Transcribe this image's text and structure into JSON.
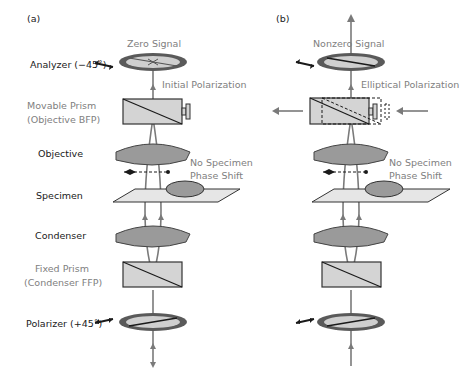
{
  "panels": [
    {
      "id": "a",
      "tag": "(a)",
      "top_label": "Zero Signal",
      "beam_label": "Initial Polarization",
      "specimen_note_line1": "No Specimen",
      "specimen_note_line2": "Phase Shift"
    },
    {
      "id": "b",
      "tag": "(b)",
      "top_label": "Nonzero Signal",
      "beam_label": "Elliptical Polarization",
      "specimen_note_line1": "No Specimen",
      "specimen_note_line2": "Phase Shift"
    }
  ],
  "component_labels": {
    "analyzer": "Analyzer (−45˚)",
    "movable_prism_line1": "Movable Prism",
    "movable_prism_line2": "(Objective BFP)",
    "objective": "Objective",
    "specimen": "Specimen",
    "condenser": "Condenser",
    "fixed_prism_line1": "Fixed Prism",
    "fixed_prism_line2": "(Condenser FFP)",
    "polarizer": "Polarizer (+45˚)"
  },
  "colors": {
    "beam": "#7a7a7a",
    "lens_fill": "#9a9a9a",
    "prism_fill": "#d4d4d4",
    "stage_fill": "#e6e6e6",
    "polarizer_rim": "#5a5a5a",
    "text_dark": "#1a1a1a",
    "text_gray": "#808080"
  }
}
